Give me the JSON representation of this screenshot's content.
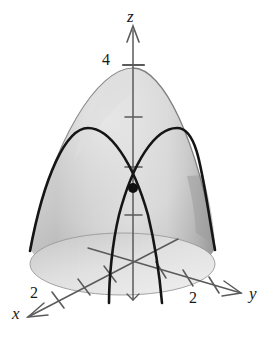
{
  "figure": {
    "kind": "3d-surface-plot",
    "background_color": "#ffffff",
    "width": 275,
    "height": 354
  },
  "axes": {
    "x": {
      "label": "x",
      "label_pos": {
        "left": 12,
        "top": 306
      },
      "color": "#555555",
      "direction": "down-left",
      "origin": {
        "x": 133,
        "y": 262
      },
      "tip": {
        "x": 27,
        "y": 317
      },
      "ticks": [
        {
          "value": "",
          "x": 110,
          "y": 274
        },
        {
          "value": "",
          "x": 84,
          "y": 287
        },
        {
          "value": "2",
          "x": 58,
          "y": 299
        }
      ],
      "tick_label": "2",
      "tick_label_pos": {
        "left": 30,
        "top": 285
      }
    },
    "y": {
      "label": "y",
      "label_pos": {
        "left": 249,
        "top": 286
      },
      "color": "#555555",
      "direction": "down-right",
      "origin": {
        "x": 133,
        "y": 262
      },
      "tip": {
        "x": 241,
        "y": 293
      },
      "ticks": [
        {
          "value": "",
          "x": 160,
          "y": 270
        },
        {
          "value": "",
          "x": 186,
          "y": 277
        },
        {
          "value": "2",
          "x": 212,
          "y": 285
        }
      ],
      "tick_label": "2",
      "tick_label_pos": {
        "left": 189,
        "top": 290
      }
    },
    "z": {
      "label": "z",
      "label_pos": {
        "left": 127,
        "top": 8
      },
      "color": "#555555",
      "direction": "up",
      "origin": {
        "x": 133,
        "y": 262
      },
      "tip": {
        "x": 133,
        "y": 26
      },
      "ticks": [
        {
          "value": "4",
          "y": 65
        },
        {
          "value": "",
          "y": 117
        },
        {
          "value": "",
          "y": 167
        },
        {
          "value": "",
          "y": 215
        }
      ],
      "tick_label": "4",
      "tick_label_pos": {
        "left": 103,
        "top": 52
      }
    }
  },
  "surface": {
    "name": "paraboloid",
    "fill_light": "#e2e2e2",
    "fill_mid": "#c9c9c9",
    "fill_dark": "#a9a9a9",
    "edge_color": "#8a8a8a",
    "apex": {
      "x": 133,
      "y": 68
    },
    "base_center": {
      "x": 122,
      "y": 265
    },
    "base_rx": 93,
    "base_ry": 31
  },
  "curves": [
    {
      "name": "parabola-in-xz-plane",
      "color": "#1a1a1a",
      "stroke_width": 2.6,
      "vertex": {
        "x": 87,
        "y": 128
      },
      "left_end": {
        "x": 30,
        "y": 253
      },
      "right_end": {
        "x": 162,
        "y": 302
      }
    },
    {
      "name": "parabola-in-yz-plane",
      "color": "#1a1a1a",
      "stroke_width": 2.6,
      "vertex": {
        "x": 177,
        "y": 128
      },
      "left_end": {
        "x": 110,
        "y": 302
      },
      "right_end": {
        "x": 215,
        "y": 251
      }
    }
  ],
  "point": {
    "name": "intersection-point",
    "x": 133,
    "y": 188,
    "radius": 5,
    "color": "#111111"
  }
}
